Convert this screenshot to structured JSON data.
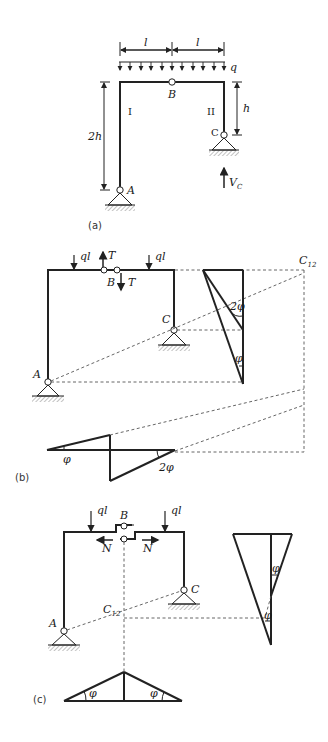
{
  "figure": {
    "panels": [
      {
        "id": "a",
        "caption": "(a)",
        "labels": {
          "span_left": "l",
          "span_right": "l",
          "load": "q",
          "hinge_B": "B",
          "member_I": "I",
          "member_II": "II",
          "height_left": "2h",
          "height_right": "h",
          "support_A": "A",
          "support_C": "C",
          "reaction": "V",
          "reaction_sub": "C"
        }
      },
      {
        "id": "b",
        "caption": "(b)",
        "labels": {
          "load_left": "ql",
          "load_right": "ql",
          "force_up": "T",
          "force_down": "T",
          "hinge_B": "B",
          "support_A": "A",
          "support_C": "C",
          "center": "C",
          "center_sub": "12",
          "angle_2phi": "2φ",
          "angle_phi": "φ",
          "diag_phi": "φ",
          "diag_2phi": "2φ"
        }
      },
      {
        "id": "c",
        "caption": "(c)",
        "labels": {
          "load_left": "ql",
          "load_right": "ql",
          "hinge_B": "B",
          "force_left": "N",
          "force_right": "N",
          "support_A": "A",
          "support_C": "C",
          "center": "C",
          "center_sub": "12",
          "angle_phi_top": "φ",
          "angle_phi_bottom": "φ",
          "diag_phi_left": "φ",
          "diag_phi_right": "φ"
        }
      }
    ]
  }
}
